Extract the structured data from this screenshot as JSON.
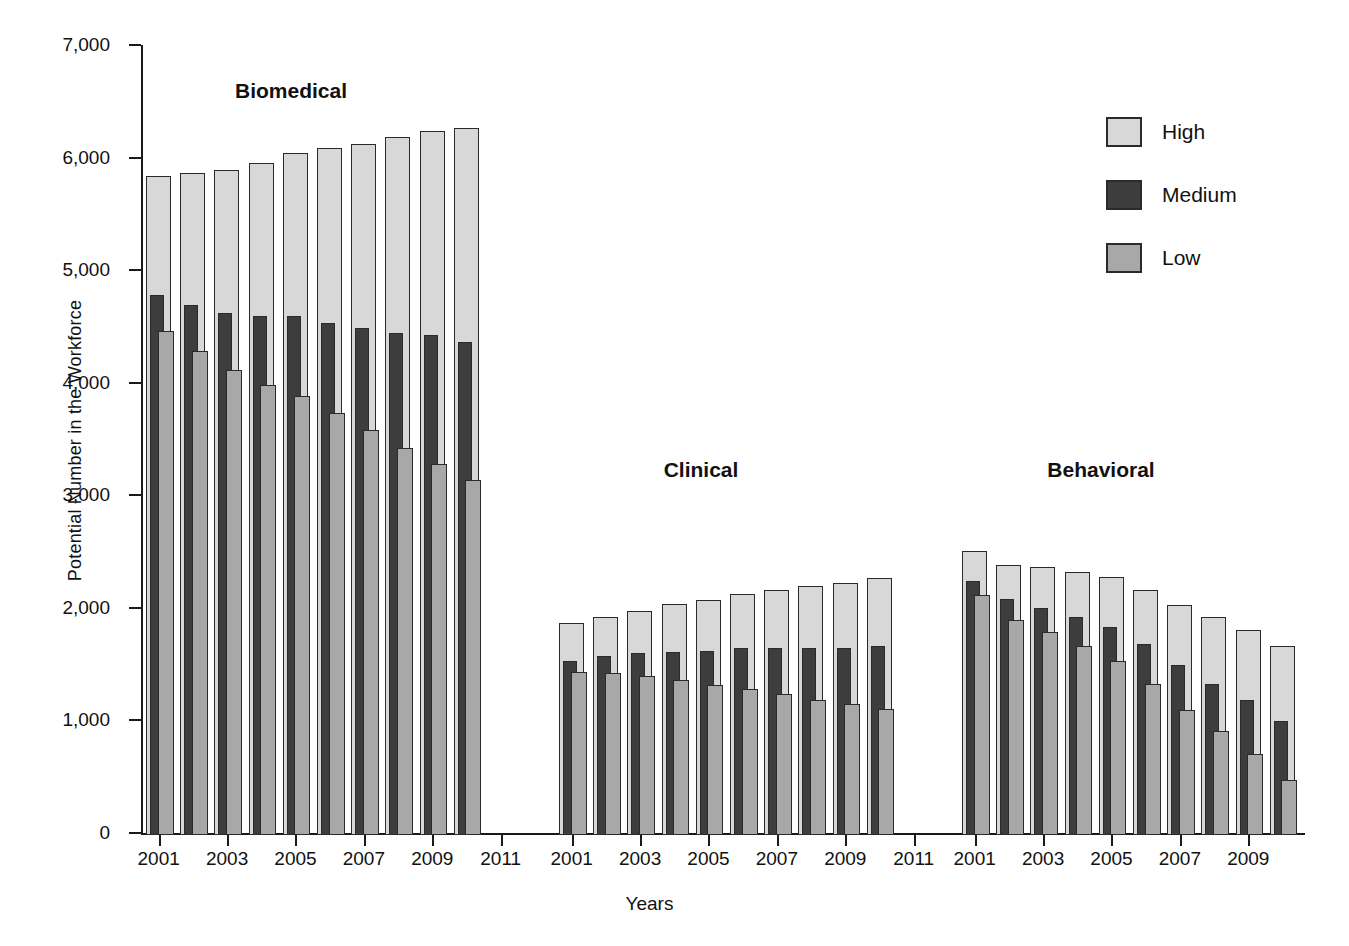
{
  "chart_data": {
    "type": "bar",
    "title": "",
    "xlabel": "Years",
    "ylabel": "Potential Number in the Workforce",
    "ylim": [
      0,
      7000
    ],
    "ytick_labels": [
      "7,000",
      "6,000",
      "5,000",
      "4,000",
      "3,000",
      "2,000",
      "1,000",
      "0"
    ],
    "ytick_values": [
      7000,
      6000,
      5000,
      4000,
      3000,
      2000,
      1000,
      0
    ],
    "grid": false,
    "legend_position": "right",
    "legend": [
      "High",
      "Medium",
      "Low"
    ],
    "series_colors": {
      "High": "#d8d8d8",
      "Medium": "#3d3d3d",
      "Low": "#a8a8a8"
    },
    "bar_style": "overlapping-clustered",
    "panels": [
      {
        "name": "Biomedical",
        "x": [
          2001,
          2002,
          2003,
          2004,
          2005,
          2006,
          2007,
          2008,
          2009,
          2010
        ],
        "xtick_labels": [
          "2001",
          "2003",
          "2005",
          "2007",
          "2009",
          "2011"
        ],
        "xtick_values": [
          2001,
          2003,
          2005,
          2007,
          2009,
          2011
        ],
        "series": [
          {
            "name": "High",
            "values": [
              5850,
              5880,
              5910,
              5970,
              6060,
              6100,
              6140,
              6200,
              6250,
              6280
            ]
          },
          {
            "name": "Medium",
            "values": [
              4800,
              4710,
              4640,
              4610,
              4610,
              4550,
              4500,
              4460,
              4440,
              4380
            ]
          },
          {
            "name": "Low",
            "values": [
              4480,
              4300,
              4130,
              4000,
              3900,
              3750,
              3600,
              3440,
              3300,
              3150
            ]
          }
        ]
      },
      {
        "name": "Clinical",
        "x": [
          2001,
          2002,
          2003,
          2004,
          2005,
          2006,
          2007,
          2008,
          2009,
          2010
        ],
        "xtick_labels": [
          "2001",
          "2003",
          "2005",
          "2007",
          "2009",
          "2011"
        ],
        "xtick_values": [
          2001,
          2003,
          2005,
          2007,
          2009,
          2011
        ],
        "series": [
          {
            "name": "High",
            "values": [
              1880,
              1940,
              1990,
              2050,
              2090,
              2140,
              2180,
              2210,
              2240,
              2280
            ]
          },
          {
            "name": "Medium",
            "values": [
              1550,
              1590,
              1620,
              1625,
              1635,
              1660,
              1660,
              1665,
              1665,
              1680
            ]
          },
          {
            "name": "Low",
            "values": [
              1450,
              1440,
              1410,
              1375,
              1330,
              1295,
              1255,
              1200,
              1165,
              1120
            ]
          }
        ]
      },
      {
        "name": "Behavioral",
        "x": [
          2001,
          2002,
          2003,
          2004,
          2005,
          2006,
          2007,
          2008,
          2009,
          2010
        ],
        "xtick_labels": [
          "2001",
          "2003",
          "2005",
          "2007",
          "2009"
        ],
        "xtick_values": [
          2001,
          2003,
          2005,
          2007,
          2009
        ],
        "series": [
          {
            "name": "High",
            "values": [
              2520,
              2400,
              2380,
              2340,
              2290,
              2180,
              2040,
              1940,
              1820,
              1680
            ]
          },
          {
            "name": "Medium",
            "values": [
              2260,
              2100,
              2020,
              1940,
              1850,
              1700,
              1510,
              1340,
              1200,
              1010
            ]
          },
          {
            "name": "Low",
            "values": [
              2130,
              1910,
              1800,
              1680,
              1545,
              1340,
              1110,
              920,
              720,
              490
            ]
          }
        ]
      }
    ]
  }
}
